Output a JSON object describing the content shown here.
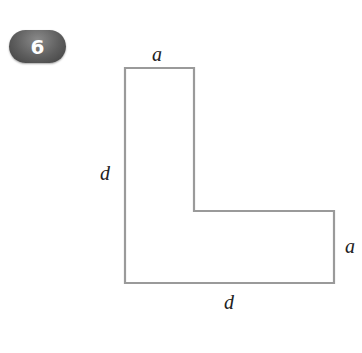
{
  "problem": {
    "number": "6"
  },
  "figure": {
    "shape": "L-shape",
    "stroke_color": "#9a9a9a",
    "labels": {
      "top": "a",
      "left": "d",
      "right": "a",
      "bottom": "d"
    },
    "vertices": [
      [
        125,
        68
      ],
      [
        194,
        68
      ],
      [
        194,
        211
      ],
      [
        334,
        211
      ],
      [
        334,
        283
      ],
      [
        125,
        283
      ]
    ]
  }
}
